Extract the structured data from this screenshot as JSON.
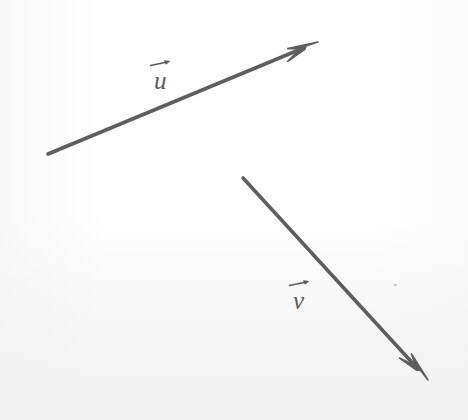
{
  "figure": {
    "background_color": "#fefefe",
    "stroke_color": "#5e5e5e",
    "width": 468,
    "height": 420
  },
  "labels": {
    "u": {
      "text": "u",
      "notation": "over-right-arrow",
      "x": 168,
      "y": 78
    },
    "v": {
      "text": "v",
      "notation": "over-right-arrow",
      "x": 306,
      "y": 298
    }
  },
  "chart_data": {
    "type": "diagram",
    "title": "",
    "xlabel": "",
    "ylabel": "",
    "coordinate_space": "image-pixels",
    "vectors": [
      {
        "name": "u",
        "label": "u",
        "tail": [
          48,
          154
        ],
        "tip": [
          318,
          42
        ],
        "dx": 270,
        "dy": -112,
        "stroke_width": 3.6,
        "color": "#5e5e5e",
        "arrowhead": "barbed",
        "label_position": [
          168,
          78
        ]
      },
      {
        "name": "v",
        "label": "v",
        "tail": [
          243,
          178
        ],
        "tip": [
          428,
          380
        ],
        "dx": 185,
        "dy": 202,
        "stroke_width": 3.6,
        "color": "#5e5e5e",
        "arrowhead": "barbed",
        "label_position": [
          306,
          298
        ]
      }
    ],
    "marks": [
      {
        "name": "speck",
        "x": 395,
        "y": 285,
        "size": 3,
        "color": "#b9b9b9"
      }
    ]
  }
}
